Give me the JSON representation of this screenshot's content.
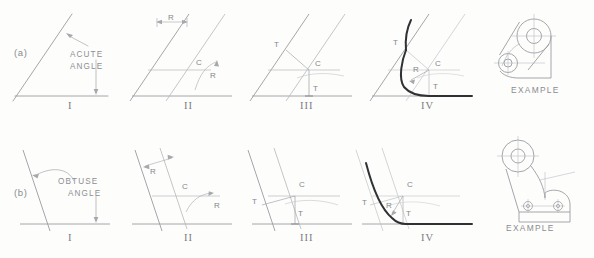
{
  "figure": {
    "background_color": "#fdfdfc",
    "line_color": "#9a9ca0",
    "construction_color": "#b6b8bc",
    "object_color": "#2f3134",
    "text_color": "#8a8c90"
  },
  "rows": [
    {
      "id": "a",
      "row_label": "(a)",
      "angle_note_line1": "ACUTE",
      "angle_note_line2": "ANGLE",
      "steps": [
        {
          "numeral": "I",
          "marks": []
        },
        {
          "numeral": "II",
          "marks": [
            "R",
            "C",
            "R"
          ]
        },
        {
          "numeral": "III",
          "marks": [
            "T",
            "C",
            "T"
          ]
        },
        {
          "numeral": "IV",
          "marks": [
            "T",
            "C",
            "R",
            "T"
          ]
        }
      ],
      "example_label": "EXAMPLE"
    },
    {
      "id": "b",
      "row_label": "(b)",
      "angle_note_line1": "OBTUSE",
      "angle_note_line2": "ANGLE",
      "steps": [
        {
          "numeral": "I",
          "marks": []
        },
        {
          "numeral": "II",
          "marks": [
            "R",
            "C",
            "R"
          ]
        },
        {
          "numeral": "III",
          "marks": [
            "T",
            "C",
            "T"
          ]
        },
        {
          "numeral": "IV",
          "marks": [
            "T",
            "C",
            "R",
            "T"
          ]
        }
      ],
      "example_label": "EXAMPLE"
    }
  ],
  "labels": {
    "row_a": "(a)",
    "row_b": "(b)",
    "acute_1": "ACUTE",
    "acute_2": "ANGLE",
    "obtuse_1": "OBTUSE",
    "obtuse_2": "ANGLE",
    "numeral_1": "I",
    "numeral_2": "II",
    "numeral_3": "III",
    "numeral_4": "IV",
    "mark_R": "R",
    "mark_C": "C",
    "mark_T": "T",
    "example": "EXAMPLE"
  }
}
